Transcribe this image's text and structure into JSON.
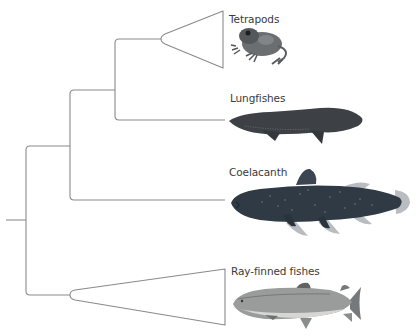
{
  "figure": {
    "type": "phylogenetic-tree",
    "line_color": "#8a8a8a",
    "label_color": "#3a3a3a",
    "background": "#ffffff"
  },
  "taxa": [
    {
      "id": "tetrapods",
      "label": "Tetrapods",
      "icon": "frog-icon",
      "collapsed_clade": true
    },
    {
      "id": "lungfishes",
      "label": "Lungfishes",
      "icon": "lungfish-icon",
      "collapsed_clade": false
    },
    {
      "id": "coelacanth",
      "label": "Coelacanth",
      "icon": "coelacanth-icon",
      "collapsed_clade": false
    },
    {
      "id": "ray-finned",
      "label": "Ray-finned fishes",
      "icon": "trout-icon",
      "collapsed_clade": true
    }
  ],
  "colors": {
    "branch": "#8a8a8a",
    "frog_body": "#6b6e70",
    "lungfish_body": "#3d4146",
    "coelacanth_body": "#2f3a44",
    "coelacanth_fin": "#b9bcc0",
    "trout_body": "#9a9c9c",
    "trout_belly": "#d6d6d4"
  }
}
